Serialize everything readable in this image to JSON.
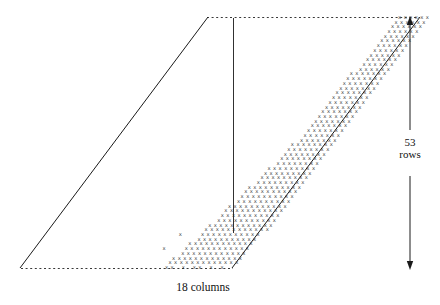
{
  "figure": {
    "title": "",
    "caption_bottom": "18 columns",
    "caption_right": "53\nrows",
    "glyph_character": "x",
    "ink_color": "#2b2b2b",
    "line_color": "#1a1a1a",
    "background_color": "#ffffff"
  },
  "annotations": {
    "rows_value": "53",
    "rows_unit": "rows",
    "columns_value": "18",
    "columns_unit": "columns",
    "rows_label": "53\nrows",
    "columns_label": "18 columns"
  },
  "chart_data": {
    "type": "heatmap",
    "title": "",
    "xlabel": "18 columns",
    "ylabel": "53 rows",
    "grid": false,
    "legend": "none",
    "n_columns": 18,
    "n_rows": 53,
    "marker": "x",
    "xlim": [
      0,
      18
    ],
    "ylim": [
      0,
      53
    ],
    "row_spans": [
      {
        "row": 53,
        "start": 8,
        "end": 13
      },
      {
        "row": 52,
        "start": 8,
        "end": 13
      },
      {
        "row": 51,
        "start": 8,
        "end": 13
      },
      {
        "row": 50,
        "start": 8,
        "end": 13
      },
      {
        "row": 49,
        "start": 8,
        "end": 13
      },
      {
        "row": 48,
        "start": 8,
        "end": 13
      },
      {
        "row": 47,
        "start": 8,
        "end": 13
      },
      {
        "row": 46,
        "start": 8,
        "end": 13
      },
      {
        "row": 45,
        "start": 8,
        "end": 13
      },
      {
        "row": 44,
        "start": 8,
        "end": 13
      },
      {
        "row": 43,
        "start": 8,
        "end": 13
      },
      {
        "row": 42,
        "start": 8,
        "end": 13
      },
      {
        "row": 41,
        "start": 7,
        "end": 13
      },
      {
        "row": 40,
        "start": 7,
        "end": 13
      },
      {
        "row": 39,
        "start": 7,
        "end": 13
      },
      {
        "row": 38,
        "start": 7,
        "end": 13
      },
      {
        "row": 37,
        "start": 7,
        "end": 13
      },
      {
        "row": 36,
        "start": 7,
        "end": 13
      },
      {
        "row": 35,
        "start": 7,
        "end": 13
      },
      {
        "row": 34,
        "start": 7,
        "end": 13
      },
      {
        "row": 33,
        "start": 7,
        "end": 13
      },
      {
        "row": 32,
        "start": 7,
        "end": 13
      },
      {
        "row": 31,
        "start": 7,
        "end": 13
      },
      {
        "row": 30,
        "start": 7,
        "end": 13
      },
      {
        "row": 29,
        "start": 7,
        "end": 13
      },
      {
        "row": 28,
        "start": 7,
        "end": 13
      },
      {
        "row": 27,
        "start": 7,
        "end": 13
      },
      {
        "row": 26,
        "start": 6,
        "end": 13
      },
      {
        "row": 25,
        "start": 6,
        "end": 13
      },
      {
        "row": 24,
        "start": 6,
        "end": 13
      },
      {
        "row": 23,
        "start": 6,
        "end": 13
      },
      {
        "row": 22,
        "start": 6,
        "end": 13
      },
      {
        "row": 21,
        "start": 5,
        "end": 13
      },
      {
        "row": 20,
        "start": 5,
        "end": 13
      },
      {
        "row": 19,
        "start": 5,
        "end": 13
      },
      {
        "row": 18,
        "start": 5,
        "end": 13
      },
      {
        "row": 17,
        "start": 4,
        "end": 13
      },
      {
        "row": 16,
        "start": 4,
        "end": 13
      },
      {
        "row": 15,
        "start": 4,
        "end": 13
      },
      {
        "row": 14,
        "start": 4,
        "end": 13
      },
      {
        "row": 13,
        "start": 3,
        "end": 13
      },
      {
        "row": 12,
        "start": 3,
        "end": 13
      },
      {
        "row": 11,
        "start": 3,
        "end": 13
      },
      {
        "row": 10,
        "start": 3,
        "end": 13
      },
      {
        "row": 9,
        "start": 2,
        "end": 13
      },
      {
        "row": 8,
        "start": 2,
        "end": 13
      },
      {
        "row": 7,
        "start": 2,
        "end": 12
      },
      {
        "row": 6,
        "start": 2,
        "end": 12
      },
      {
        "row": 5,
        "start": 1,
        "end": 12
      },
      {
        "row": 4,
        "start": 1,
        "end": 12
      },
      {
        "row": 3,
        "start": 1,
        "end": 12
      },
      {
        "row": 2,
        "start": 0,
        "end": 12
      },
      {
        "row": 1,
        "start": 0,
        "end": 12
      }
    ],
    "outlier_cells": [
      {
        "row": 7,
        "col": -2
      },
      {
        "row": 4,
        "col": -3
      }
    ],
    "sparse_bottom_row": {
      "row": 0,
      "pattern": "xx|x|x||xx||",
      "cols": [
        0,
        1,
        3,
        5,
        6,
        8,
        10
      ]
    }
  },
  "geometry": {
    "shear_note": "Rows are sheared right-to-left going upward; the bounding parallelogram is outlined by two parallel diagonal rules and two dotted horizontal reference rules.",
    "diagonal_left": {
      "x1": 20,
      "y1": 268,
      "x2": 208,
      "y2": 17
    },
    "diagonal_right": {
      "x1": 232,
      "y1": 268,
      "x2": 420,
      "y2": 17
    },
    "dotted_top": {
      "x1": 207,
      "y1": 17,
      "x2": 419,
      "y2": 17
    },
    "dotted_bottom": {
      "x1": 21,
      "y1": 268,
      "x2": 233,
      "y2": 268
    },
    "measure_arrow": {
      "x": 410,
      "y_top": 18,
      "y_bottom": 268
    },
    "block_right_rule": {
      "x": 233,
      "y1": 18,
      "y2": 233
    }
  },
  "icons": {
    "arrow_up": "arrow-up-icon",
    "arrow_down": "arrow-down-icon"
  }
}
